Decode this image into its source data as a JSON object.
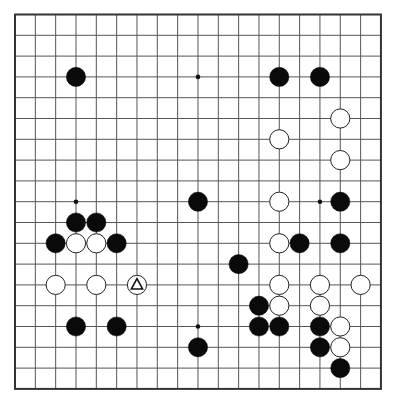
{
  "board": {
    "size": 19,
    "origin_x": 15,
    "origin_y": 14.5,
    "spacing_x": 20.33,
    "spacing_y": 20.8,
    "stone_radius": 9.6,
    "colors": {
      "background": "#ffffff",
      "line": "#555555",
      "black_stone": "#0a0a0a",
      "white_stone": "#ffffff"
    },
    "hoshi": [
      [
        3,
        3
      ],
      [
        9,
        3
      ],
      [
        15,
        3
      ],
      [
        3,
        9
      ],
      [
        9,
        9
      ],
      [
        15,
        9
      ],
      [
        3,
        15
      ],
      [
        9,
        15
      ],
      [
        15,
        15
      ]
    ],
    "stones": {
      "black": [
        [
          3,
          3
        ],
        [
          13,
          3
        ],
        [
          15,
          3
        ],
        [
          9,
          9
        ],
        [
          16,
          9
        ],
        [
          3,
          10
        ],
        [
          4,
          10
        ],
        [
          2,
          11
        ],
        [
          5,
          11
        ],
        [
          14,
          11
        ],
        [
          16,
          11
        ],
        [
          11,
          12
        ],
        [
          12,
          14
        ],
        [
          3,
          15
        ],
        [
          5,
          15
        ],
        [
          12,
          15
        ],
        [
          13,
          15
        ],
        [
          15,
          15
        ],
        [
          9,
          16
        ],
        [
          15,
          16
        ],
        [
          16,
          17
        ]
      ],
      "white": [
        [
          16,
          5
        ],
        [
          13,
          6
        ],
        [
          16,
          7
        ],
        [
          13,
          9
        ],
        [
          3,
          11
        ],
        [
          4,
          11
        ],
        [
          13,
          11
        ],
        [
          2,
          13
        ],
        [
          4,
          13
        ],
        [
          6,
          13
        ],
        [
          13,
          13
        ],
        [
          15,
          13
        ],
        [
          17,
          13
        ],
        [
          13,
          14
        ],
        [
          15,
          14
        ],
        [
          16,
          15
        ],
        [
          16,
          16
        ]
      ]
    },
    "markers": [
      {
        "type": "triangle",
        "col": 6,
        "row": 13,
        "on": "white"
      }
    ]
  }
}
